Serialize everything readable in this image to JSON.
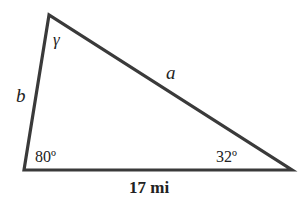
{
  "figure": {
    "type": "triangle",
    "stroke_color": "#3a3a3a",
    "vertices": {
      "top": {
        "x": 49,
        "y": 15
      },
      "bottom_left": {
        "x": 24,
        "y": 170
      },
      "bottom_right": {
        "x": 292,
        "y": 170
      }
    },
    "side_labels": {
      "a": "a",
      "b": "b",
      "base": "17 mi"
    },
    "angle_labels": {
      "top": "γ",
      "bottom_left": "80º",
      "bottom_right": "32º"
    }
  }
}
